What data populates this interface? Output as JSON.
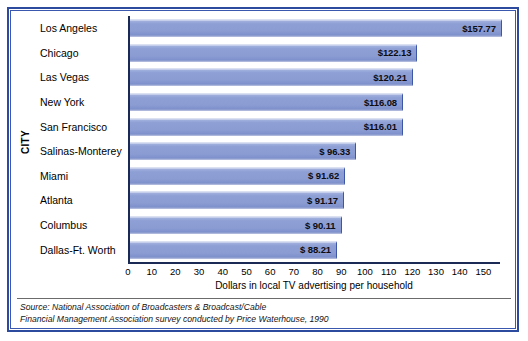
{
  "chart_data": {
    "type": "bar",
    "orientation": "horizontal",
    "title": "",
    "xlabel": "Dollars in local TV advertising per household",
    "ylabel": "CITY",
    "categories": [
      "Los Angeles",
      "Chicago",
      "Las Vegas",
      "New York",
      "San Francisco",
      "Salinas-Monterey",
      "Miami",
      "Atlanta",
      "Columbus",
      "Dallas-Ft. Worth"
    ],
    "values": [
      157.77,
      122.13,
      120.21,
      116.08,
      116.01,
      96.33,
      91.62,
      91.17,
      90.11,
      88.21
    ],
    "value_labels": [
      "$157.77",
      "$122.13",
      "$120.21",
      "$116.08",
      "$116.01",
      "$ 96.33",
      "$ 91.62",
      "$ 91.17",
      "$ 90.11",
      "$ 88.21"
    ],
    "xlim": [
      0,
      157
    ],
    "xticks": [
      0,
      10,
      20,
      30,
      40,
      50,
      60,
      70,
      80,
      90,
      100,
      110,
      120,
      130,
      140,
      150
    ],
    "xtick_labels": [
      "0",
      "10",
      "20",
      "30",
      "40",
      "50",
      "60",
      "70",
      "80",
      "90",
      "100",
      "110",
      "120",
      "130",
      "140",
      "150"
    ],
    "grid": false,
    "legend": null,
    "bar_color": "#8b9dd4",
    "frame_color": "#2c4a9e",
    "axis_color": "#1b2a55"
  },
  "footnote": {
    "line1": "Source: National Association of Broadcasters & Broadcast/Cable",
    "line2": "Financial Management Association survey conducted by Price Waterhouse, 1990"
  }
}
